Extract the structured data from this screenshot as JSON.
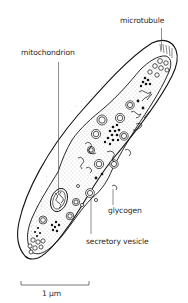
{
  "figure": {
    "type": "biological cell diagram"
  },
  "labels": {
    "microtubule": "microtubule",
    "mitochondrion": "mitochondrion",
    "glycogen": "glycogen",
    "secretory_vesicle": "secretory vesicle"
  },
  "scale_bar": {
    "label": "1 µm"
  },
  "colors": {
    "ink": "#1a1a1a",
    "label_text": "#2a2a2a",
    "background": "#ffffff"
  }
}
